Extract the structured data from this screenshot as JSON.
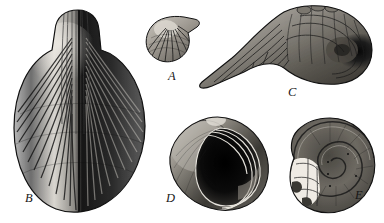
{
  "plate": {
    "kind": "engraved-fossil-shell-plate",
    "background_color": "#ffffff",
    "ink_color": "#1a1a1a",
    "width": 384,
    "height": 223,
    "specimen_count": 5
  },
  "specimens": [
    {
      "label": "A",
      "name": "ribbed-bivalve-shell",
      "description": "small ribbed bivalve shell, radiating costae, hinge at upper right",
      "label_x": 168,
      "label_y": 70,
      "box": {
        "x": 144,
        "y": 14,
        "w": 60,
        "h": 52
      }
    },
    {
      "label": "B",
      "name": "large-oval-ribbed-shell",
      "description": "large oval shell with prominent raised central beak and dense radiating ribs",
      "label_x": 25,
      "label_y": 192,
      "box": {
        "x": 10,
        "y": 8,
        "w": 136,
        "h": 207
      }
    },
    {
      "label": "C",
      "name": "coiled-gastropod-with-rostrum",
      "description": "coiled gastropod with long tapering wing-like rostrum extending to the left",
      "label_x": 288,
      "label_y": 86,
      "box": {
        "x": 196,
        "y": 6,
        "w": 186,
        "h": 80
      }
    },
    {
      "label": "D",
      "name": "gastropod-aperture-view",
      "description": "globose snail shell seen from the aperture showing the large mouth opening",
      "label_x": 166,
      "label_y": 192,
      "box": {
        "x": 168,
        "y": 116,
        "w": 104,
        "h": 96
      }
    },
    {
      "label": "E",
      "name": "planispiral-coiled-shell",
      "description": "planispiral coiled shell with broken pale aperture region at lower left",
      "label_x": 355,
      "label_y": 189,
      "box": {
        "x": 288,
        "y": 118,
        "w": 88,
        "h": 96
      }
    }
  ]
}
